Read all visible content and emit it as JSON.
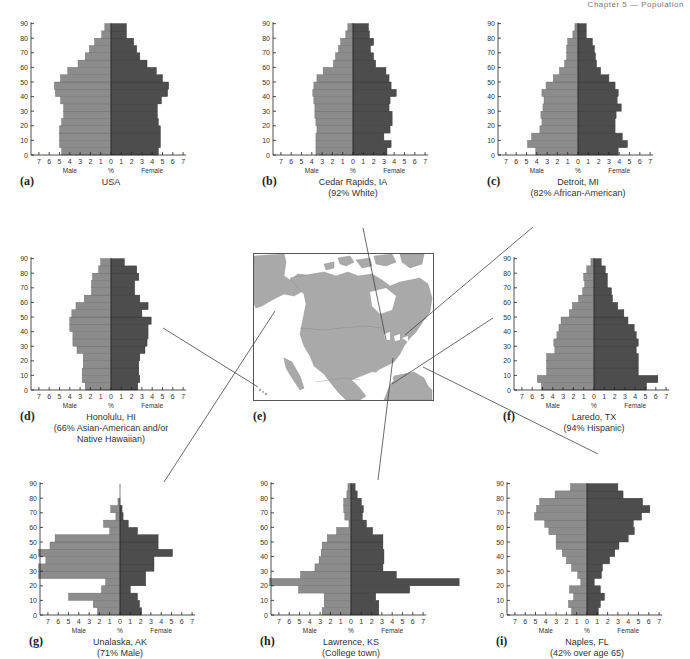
{
  "header": {
    "text": "Chapter 5 — Population"
  },
  "axis": {
    "y_ticks": [
      0,
      10,
      20,
      30,
      40,
      50,
      60,
      70,
      80,
      90
    ],
    "x_ticks": [
      7,
      6,
      5,
      4,
      3,
      2,
      1,
      0,
      1,
      2,
      3,
      4,
      5,
      6,
      7
    ],
    "male_label": "Male",
    "female_label": "Female",
    "unit_label": "%"
  },
  "colors": {
    "male": "#8c8c8c",
    "female": "#4d4d4d",
    "line": "#444444",
    "land": "#a9a9a9"
  },
  "map": {
    "letter": "(e)"
  },
  "chart_data": [
    {
      "type": "bar",
      "id": "a",
      "letter": "(a)",
      "title": "USA",
      "subtitle": "",
      "xlabel": "%",
      "ylabel": "Age",
      "xlim": [
        -7,
        7
      ],
      "ylim": [
        0,
        90
      ],
      "categories": [
        "0-4",
        "5-9",
        "10-14",
        "15-19",
        "20-24",
        "25-29",
        "30-34",
        "35-39",
        "40-44",
        "45-49",
        "50-54",
        "55-59",
        "60-64",
        "65-69",
        "70-74",
        "75-79",
        "80-84",
        "85-89"
      ],
      "series": [
        {
          "name": "Male",
          "values": [
            4.8,
            5.0,
            5.0,
            5.0,
            4.8,
            4.6,
            4.6,
            4.9,
            5.4,
            5.5,
            4.9,
            4.2,
            3.2,
            2.5,
            2.1,
            1.6,
            0.9,
            0.6
          ]
        },
        {
          "name": "Female",
          "values": [
            4.6,
            4.8,
            4.8,
            4.8,
            4.6,
            4.5,
            4.5,
            4.9,
            5.5,
            5.6,
            5.0,
            4.4,
            3.5,
            2.8,
            2.5,
            2.2,
            1.5,
            1.5
          ]
        }
      ]
    },
    {
      "type": "bar",
      "id": "b",
      "letter": "(b)",
      "title": "Cedar Rapids, IA",
      "subtitle": "(92% White)",
      "xlabel": "%",
      "ylabel": "Age",
      "xlim": [
        -7,
        7
      ],
      "ylim": [
        0,
        90
      ],
      "categories": [
        "0-4",
        "5-9",
        "10-14",
        "15-19",
        "20-24",
        "25-29",
        "30-34",
        "35-39",
        "40-44",
        "45-49",
        "50-54",
        "55-59",
        "60-64",
        "65-69",
        "70-74",
        "75-79",
        "80-84",
        "85-89"
      ],
      "series": [
        {
          "name": "Male",
          "values": [
            3.6,
            3.6,
            3.6,
            3.5,
            3.6,
            3.7,
            3.7,
            3.8,
            3.9,
            3.8,
            3.5,
            2.9,
            1.9,
            1.7,
            1.4,
            1.2,
            0.7,
            0.5
          ]
        },
        {
          "name": "Female",
          "values": [
            3.3,
            3.7,
            3.0,
            3.6,
            3.8,
            3.8,
            3.5,
            3.6,
            4.2,
            3.7,
            3.5,
            3.2,
            2.2,
            2.0,
            1.7,
            2.0,
            1.6,
            1.5
          ]
        }
      ]
    },
    {
      "type": "bar",
      "id": "c",
      "letter": "(c)",
      "title": "Detroit, MI",
      "subtitle": "(82% African-American)",
      "xlabel": "%",
      "ylabel": "Age",
      "xlim": [
        -7,
        7
      ],
      "ylim": [
        0,
        90
      ],
      "categories": [
        "0-4",
        "5-9",
        "10-14",
        "15-19",
        "20-24",
        "25-29",
        "30-34",
        "35-39",
        "40-44",
        "45-49",
        "50-54",
        "55-59",
        "60-64",
        "65-69",
        "70-74",
        "75-79",
        "80-84",
        "85-89"
      ],
      "series": [
        {
          "name": "Male",
          "values": [
            4.1,
            4.9,
            4.5,
            3.7,
            3.5,
            3.6,
            3.4,
            3.3,
            3.5,
            3.1,
            2.4,
            1.8,
            1.3,
            1.1,
            1.1,
            1.0,
            0.5,
            0.3
          ]
        },
        {
          "name": "Female",
          "values": [
            3.9,
            4.8,
            4.3,
            3.6,
            3.6,
            3.7,
            4.2,
            3.8,
            3.9,
            3.6,
            3.0,
            2.2,
            1.8,
            1.7,
            1.6,
            1.4,
            0.8,
            0.8
          ]
        }
      ]
    },
    {
      "type": "bar",
      "id": "d",
      "letter": "(d)",
      "title": "Honolulu, HI",
      "subtitle": "(66% Asian-American and/or Native Hawaiian)",
      "xlabel": "%",
      "ylabel": "Age",
      "xlim": [
        -7,
        7
      ],
      "ylim": [
        0,
        90
      ],
      "categories": [
        "0-4",
        "5-9",
        "10-14",
        "15-19",
        "20-24",
        "25-29",
        "30-34",
        "35-39",
        "40-44",
        "45-49",
        "50-54",
        "55-59",
        "60-64",
        "65-69",
        "70-74",
        "75-79",
        "80-84",
        "85-89"
      ],
      "series": [
        {
          "name": "Male",
          "values": [
            2.5,
            2.8,
            2.8,
            2.7,
            2.7,
            3.3,
            3.7,
            3.7,
            4.0,
            4.0,
            3.8,
            3.4,
            2.6,
            1.9,
            1.9,
            1.8,
            1.2,
            1.0
          ]
        },
        {
          "name": "Female",
          "values": [
            2.6,
            2.8,
            2.7,
            2.7,
            2.8,
            3.3,
            3.5,
            3.6,
            3.6,
            3.9,
            3.0,
            3.6,
            2.8,
            2.3,
            2.3,
            2.7,
            2.5,
            1.3
          ]
        }
      ]
    },
    {
      "type": "bar",
      "id": "f",
      "letter": "(f)",
      "title": "Laredo, TX",
      "subtitle": "(94% Hispanic)",
      "xlabel": "%",
      "ylabel": "Age",
      "xlim": [
        -7,
        7
      ],
      "ylim": [
        0,
        90
      ],
      "categories": [
        "0-4",
        "5-9",
        "10-14",
        "15-19",
        "20-24",
        "25-29",
        "30-34",
        "35-39",
        "40-44",
        "45-49",
        "50-54",
        "55-59",
        "60-64",
        "65-69",
        "70-74",
        "75-79",
        "80-84",
        "85-89"
      ],
      "series": [
        {
          "name": "Male",
          "values": [
            5.1,
            5.5,
            4.6,
            4.6,
            4.6,
            3.8,
            3.9,
            3.6,
            3.4,
            3.2,
            2.4,
            2.1,
            1.5,
            1.1,
            0.9,
            1.0,
            0.7,
            0.3
          ]
        },
        {
          "name": "Female",
          "values": [
            5.1,
            6.2,
            4.3,
            4.3,
            4.3,
            4.1,
            4.3,
            4.1,
            3.9,
            3.3,
            2.9,
            2.3,
            1.8,
            1.7,
            1.3,
            1.3,
            1.1,
            0.7
          ]
        }
      ]
    },
    {
      "type": "bar",
      "id": "g",
      "letter": "(g)",
      "title": "Unalaska, AK",
      "subtitle": "(71% Male)",
      "xlabel": "%",
      "ylabel": "Age",
      "xlim": [
        -7,
        7
      ],
      "ylim": [
        0,
        90
      ],
      "annotations": [
        "15.9% (ages 30-34)",
        "13.9% (ages 40-44)"
      ],
      "categories": [
        "0-4",
        "5-9",
        "10-14",
        "15-19",
        "20-24",
        "25-29",
        "30-34",
        "35-39",
        "40-44",
        "45-49",
        "50-54",
        "55-59",
        "60-64",
        "65-69",
        "70-74",
        "75-79",
        "80-84",
        "85-89"
      ],
      "series": [
        {
          "name": "Male",
          "values": [
            2.2,
            2.6,
            5.0,
            1.8,
            1.4,
            8.0,
            13.9,
            7.2,
            15.9,
            6.8,
            6.3,
            1.0,
            1.6,
            0.4,
            0.9,
            0.2,
            0.0,
            0.0
          ]
        },
        {
          "name": "Female",
          "values": [
            2.1,
            1.9,
            1.7,
            1.0,
            2.5,
            2.5,
            3.3,
            3.3,
            5.1,
            3.7,
            3.7,
            1.7,
            0.8,
            0.3,
            0.2,
            0.0,
            0.0,
            0.0
          ]
        }
      ]
    },
    {
      "type": "bar",
      "id": "h",
      "letter": "(h)",
      "title": "Lawrence, KS",
      "subtitle": "(College town)",
      "xlabel": "%",
      "ylabel": "Age",
      "xlim": [
        -7,
        7
      ],
      "ylim": [
        0,
        90
      ],
      "annotations": [
        "~11% male (ages 20-24)",
        "~11% female (ages 20-24)"
      ],
      "categories": [
        "0-4",
        "5-9",
        "10-14",
        "15-19",
        "20-24",
        "25-29",
        "30-34",
        "35-39",
        "40-44",
        "45-49",
        "50-54",
        "55-59",
        "60-64",
        "65-69",
        "70-74",
        "75-79",
        "80-84",
        "85-89"
      ],
      "series": [
        {
          "name": "Male",
          "values": [
            2.8,
            2.6,
            2.6,
            5.1,
            11.3,
            4.9,
            3.5,
            3.1,
            2.9,
            2.8,
            2.3,
            1.4,
            0.2,
            0.6,
            0.7,
            0.7,
            0.4,
            0.3
          ]
        },
        {
          "name": "Female",
          "values": [
            2.7,
            2.7,
            2.4,
            5.7,
            10.8,
            4.4,
            3.1,
            3.2,
            3.2,
            3.1,
            3.1,
            2.1,
            1.5,
            1.1,
            1.2,
            1.0,
            0.6,
            0.4
          ]
        }
      ]
    },
    {
      "type": "bar",
      "id": "i",
      "letter": "(i)",
      "title": "Naples, FL",
      "subtitle": "(42% over age 65)",
      "xlabel": "%",
      "ylabel": "Age",
      "xlim": [
        -7,
        7
      ],
      "ylim": [
        0,
        90
      ],
      "categories": [
        "0-4",
        "5-9",
        "10-14",
        "15-19",
        "20-24",
        "25-29",
        "30-34",
        "35-39",
        "40-44",
        "45-49",
        "50-54",
        "55-59",
        "60-64",
        "65-69",
        "70-74",
        "75-79",
        "80-84",
        "85-89"
      ],
      "series": [
        {
          "name": "Male",
          "values": [
            1.5,
            1.8,
            1.3,
            1.7,
            0.6,
            0.9,
            1.5,
            2.0,
            2.4,
            3.0,
            3.0,
            3.7,
            4.1,
            5.1,
            4.9,
            4.6,
            3.1,
            1.6
          ]
        },
        {
          "name": "Female",
          "values": [
            1.1,
            1.3,
            1.7,
            1.3,
            0.7,
            1.4,
            1.5,
            2.2,
            2.7,
            3.1,
            4.0,
            4.6,
            4.5,
            5.3,
            6.1,
            5.4,
            3.5,
            3.0
          ]
        }
      ]
    }
  ]
}
